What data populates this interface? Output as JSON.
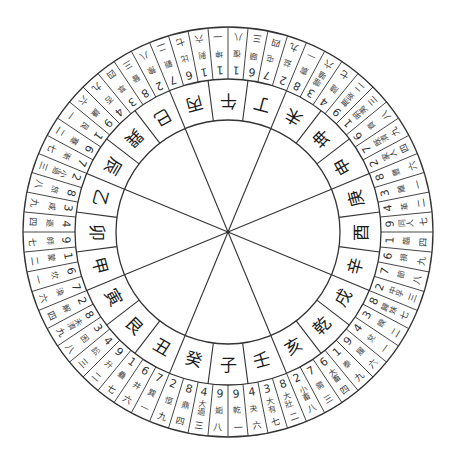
{
  "diagram": {
    "title": "",
    "type": "luopan-compass",
    "center": {
      "x": 228,
      "y": 232
    },
    "radii": {
      "outer": 205,
      "hex_inner": 153,
      "mountain_inner": 112
    },
    "colors": {
      "line": "#333333",
      "text": "#222222",
      "background": "#ffffff"
    },
    "spokes_count": 8,
    "mountains": [
      "午",
      "丁",
      "未",
      "坤",
      "申",
      "庚",
      "酉",
      "辛",
      "戌",
      "乾",
      "亥",
      "壬",
      "子",
      "癸",
      "丑",
      "艮",
      "寅",
      "甲",
      "卯",
      "乙",
      "辰",
      "巽",
      "巳",
      "丙"
    ],
    "hexagrams": [
      {
        "num": "9",
        "name": "姤",
        "star": "八"
      },
      {
        "num": "4",
        "name": "大過",
        "star": "三"
      },
      {
        "num": "8",
        "name": "鼎",
        "star": "四"
      },
      {
        "num": "2",
        "name": "恒",
        "star": "九"
      },
      {
        "num": "7",
        "name": "巽",
        "star": "一"
      },
      {
        "num": "6",
        "name": "井",
        "star": "六"
      },
      {
        "num": "1",
        "name": "蠱",
        "star": "七"
      },
      {
        "num": "9",
        "name": "升",
        "star": "二"
      },
      {
        "num": "4",
        "name": "訟",
        "star": "三"
      },
      {
        "num": "3",
        "name": "困",
        "star": "八"
      },
      {
        "num": "8",
        "name": "未濟",
        "star": "九"
      },
      {
        "num": "2",
        "name": "解",
        "star": "四"
      },
      {
        "num": "7",
        "name": "渙",
        "star": "六"
      },
      {
        "num": "6",
        "name": "坎",
        "star": "一"
      },
      {
        "num": "1",
        "name": "蒙",
        "star": "二"
      },
      {
        "num": "9",
        "name": "師",
        "star": "七"
      },
      {
        "num": "4",
        "name": "遯",
        "star": "四"
      },
      {
        "num": "3",
        "name": "咸",
        "star": "九"
      },
      {
        "num": "8",
        "name": "旅",
        "star": "八"
      },
      {
        "num": "2",
        "name": "小過",
        "star": "三"
      },
      {
        "num": "7",
        "name": "漸",
        "star": "七"
      },
      {
        "num": "6",
        "name": "蹇",
        "star": "二"
      },
      {
        "num": "1",
        "name": "艮",
        "star": "一"
      },
      {
        "num": "9",
        "name": "謙",
        "star": "六"
      },
      {
        "num": "4",
        "name": "否",
        "star": "九"
      },
      {
        "num": "3",
        "name": "萃",
        "star": "四"
      },
      {
        "num": "8",
        "name": "晉",
        "star": "三"
      },
      {
        "num": "2",
        "name": "豫",
        "star": "八"
      },
      {
        "num": "7",
        "name": "觀",
        "star": "二"
      },
      {
        "num": "6",
        "name": "比",
        "star": "七"
      },
      {
        "num": "1",
        "name": "剝",
        "star": "六"
      },
      {
        "num": "1",
        "name": "坤",
        "star": "一"
      },
      {
        "num": "1",
        "name": "復",
        "star": "八"
      },
      {
        "num": "6",
        "name": "頤",
        "star": "三"
      },
      {
        "num": "7",
        "name": "屯",
        "star": "四"
      },
      {
        "num": "2",
        "name": "益",
        "star": "九"
      },
      {
        "num": "8",
        "name": "震",
        "star": "一"
      },
      {
        "num": "3",
        "name": "噬嗑",
        "star": "六"
      },
      {
        "num": "4",
        "name": "隨",
        "star": "七"
      },
      {
        "num": "9",
        "name": "無妄",
        "star": "二"
      },
      {
        "num": "1",
        "name": "明夷",
        "star": "三"
      },
      {
        "num": "6",
        "name": "賁",
        "star": "八"
      },
      {
        "num": "7",
        "name": "既濟",
        "star": "九"
      },
      {
        "num": "2",
        "name": "家人",
        "star": "四"
      },
      {
        "num": "8",
        "name": "豐",
        "star": "六"
      },
      {
        "num": "3",
        "name": "離",
        "star": "一"
      },
      {
        "num": "4",
        "name": "革",
        "star": "二"
      },
      {
        "num": "9",
        "name": "同人",
        "star": "七"
      },
      {
        "num": "1",
        "name": "臨",
        "star": "四"
      },
      {
        "num": "6",
        "name": "損",
        "star": "九"
      },
      {
        "num": "7",
        "name": "節",
        "star": "八"
      },
      {
        "num": "2",
        "name": "中孚",
        "star": "三"
      },
      {
        "num": "8",
        "name": "歸妹",
        "star": "七"
      },
      {
        "num": "3",
        "name": "睽",
        "star": "二"
      },
      {
        "num": "4",
        "name": "兌",
        "star": "一"
      },
      {
        "num": "9",
        "name": "履",
        "star": "六"
      },
      {
        "num": "1",
        "name": "泰",
        "star": "九"
      },
      {
        "num": "6",
        "name": "大畜",
        "star": "四"
      },
      {
        "num": "7",
        "name": "需",
        "star": "三"
      },
      {
        "num": "2",
        "name": "小畜",
        "star": "八"
      },
      {
        "num": "8",
        "name": "大壯",
        "star": "二"
      },
      {
        "num": "3",
        "name": "大有",
        "star": "七"
      },
      {
        "num": "4",
        "name": "夬",
        "star": "六"
      },
      {
        "num": "9",
        "name": "乾",
        "star": "一"
      }
    ]
  }
}
